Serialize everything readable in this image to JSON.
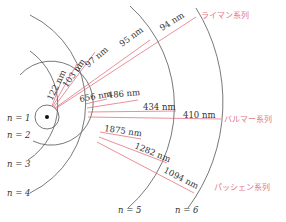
{
  "diagram": {
    "levels": [
      "n = 1",
      "n = 2",
      "n = 3",
      "n = 4",
      "n = 5",
      "n = 6"
    ],
    "series": {
      "lyman": {
        "name": "ライマン系列",
        "lines": [
          "122 nm",
          "103 nm",
          "97 nm",
          "95 nm",
          "94 nm"
        ]
      },
      "balmer": {
        "name": "バルマー系列",
        "lines": [
          "656 nm",
          "486 nm",
          "434 nm",
          "410 nm"
        ]
      },
      "paschen": {
        "name": "パッシェン系列",
        "lines": [
          "1875 nm",
          "1282 nm",
          "1094 nm"
        ]
      }
    },
    "colors": {
      "orbit": "#555555",
      "transition": "#e06070",
      "series_label": "#e07888"
    }
  }
}
